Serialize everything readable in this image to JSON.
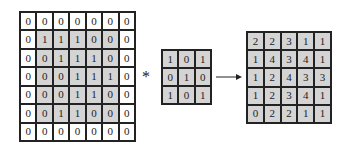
{
  "input_matrix": {
    "rows": [
      [
        0,
        0,
        0,
        0,
        0,
        0,
        0
      ],
      [
        0,
        1,
        1,
        1,
        0,
        0,
        0
      ],
      [
        0,
        0,
        1,
        1,
        1,
        0,
        0
      ],
      [
        0,
        0,
        0,
        1,
        1,
        1,
        0
      ],
      [
        0,
        0,
        0,
        1,
        1,
        0,
        0
      ],
      [
        0,
        0,
        1,
        1,
        0,
        0,
        0
      ],
      [
        0,
        0,
        0,
        0,
        0,
        0,
        0
      ]
    ],
    "shaded_region": {
      "row_start": 1,
      "row_end": 5,
      "col_start": 1,
      "col_end": 5
    }
  },
  "operator": "*",
  "kernel": {
    "rows": [
      [
        1,
        0,
        1
      ],
      [
        0,
        1,
        0
      ],
      [
        1,
        0,
        1
      ]
    ]
  },
  "output_matrix": {
    "rows": [
      [
        2,
        2,
        3,
        1,
        1
      ],
      [
        1,
        4,
        3,
        4,
        1
      ],
      [
        1,
        2,
        4,
        3,
        3
      ],
      [
        1,
        2,
        3,
        4,
        1
      ],
      [
        0,
        2,
        2,
        1,
        1
      ]
    ]
  },
  "arrow_icon": "right-arrow",
  "colors": {
    "shade": "#d4d4d4",
    "border": "#222222",
    "background": "#ffffff"
  }
}
